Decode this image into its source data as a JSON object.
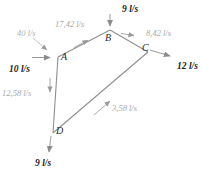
{
  "figure": {
    "type": "pipe-network-flow-diagram",
    "unit": "l/s",
    "colors": {
      "pipe_line": "#8f8f8f",
      "internal_label": "#a8a8a8",
      "external_label": "#1c1c1c",
      "node_label": "#2b2b2b",
      "arrow": "#9a9a9a",
      "background": "#ffffff"
    }
  },
  "nodes": [
    {
      "id": "A",
      "label": "A",
      "x": 58,
      "y": 57
    },
    {
      "id": "B",
      "label": "B",
      "x": 110,
      "y": 30
    },
    {
      "id": "C",
      "label": "C",
      "x": 148,
      "y": 52
    },
    {
      "id": "D",
      "label": "D",
      "x": 53,
      "y": 133
    }
  ],
  "pipes": [
    {
      "id": "AB",
      "from": "A",
      "to": "B",
      "label": "17,42 l/s",
      "value": 17.42
    },
    {
      "id": "BC",
      "from": "B",
      "to": "C",
      "label": "8,42 l/s",
      "value": 8.42
    },
    {
      "id": "AD",
      "from": "A",
      "to": "D",
      "label": "12,58 l/s",
      "value": 12.58
    },
    {
      "id": "DC",
      "from": "D",
      "to": "C",
      "label": "3,58 l/s",
      "value": 3.58
    }
  ],
  "external_flows": [
    {
      "id": "inflow-upper-left",
      "label": "40 l/s",
      "value": 40,
      "direction": "in",
      "style": "faint"
    },
    {
      "id": "inflow-left-A",
      "label": "10 l/s",
      "value": 10,
      "direction": "in",
      "style": "bold"
    },
    {
      "id": "inflow-top-B",
      "label": "9 l/s",
      "value": 9,
      "direction": "in",
      "style": "bold"
    },
    {
      "id": "outflow-right-C",
      "label": "12 l/s",
      "value": 12,
      "direction": "out",
      "style": "bold"
    },
    {
      "id": "outflow-bottom-D",
      "label": "9 l/s",
      "value": 9,
      "direction": "out",
      "style": "bold"
    }
  ]
}
